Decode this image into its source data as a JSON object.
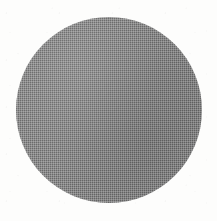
{
  "image": {
    "kind": "scanned-halftone-figure",
    "width_px": 217,
    "height_px": 221,
    "background_color": "#fdfdfc",
    "caption": "",
    "title": "",
    "has_text": false,
    "has_border": false
  },
  "chart_data": {
    "type": "pie",
    "title": "",
    "subtitle": "",
    "xlabel": "",
    "ylabel": "",
    "grid": false,
    "legend_position": "none",
    "categories": [
      "Disc"
    ],
    "values": [
      100
    ],
    "labels": [
      ""
    ],
    "colors": [
      "#8a8a8a"
    ],
    "annotations": []
  },
  "shapes": {
    "disc": {
      "name": "gray-disc",
      "shape": "circle",
      "center_x_px": 108,
      "center_y_px": 110,
      "diameter_px": 186,
      "radius_px": 93,
      "left_px": 16,
      "top_px": 17,
      "fill_color": "#8a8a8a",
      "fill_style": "halftone-dither",
      "halftone_cell_px": 2,
      "halftone_coverage_pct": 50,
      "edge": "antialiased",
      "edge_softness_px": 1.5,
      "stroke_color": "none",
      "stroke_width_px": 0
    }
  },
  "texture": {
    "pattern": "checkerboard",
    "description": "fine 50-percent checkerboard dot screen",
    "mean_gray_hex": "#8a8a8a",
    "dark_cell_hex": "#6b6b6b",
    "light_cell_hex": "#a8a8a8",
    "paper_speckle": true
  }
}
